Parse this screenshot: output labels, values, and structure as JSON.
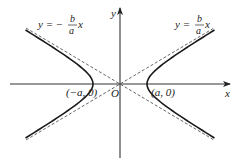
{
  "figure": {
    "axes": {
      "x_label": "x",
      "y_label": "y",
      "origin_label": "O"
    },
    "vertices": {
      "left_label": "(−a, 0)",
      "right_label": "(a, 0)"
    },
    "asymptotes": {
      "left_label_prefix": "y = −",
      "right_label_prefix": "y =",
      "fraction_numerator": "b",
      "fraction_denominator": "a",
      "variable": "x"
    },
    "colors": {
      "curve": "#1a1a1a",
      "axis": "#333333",
      "asymptote": "#555555",
      "text": "#222222"
    }
  }
}
